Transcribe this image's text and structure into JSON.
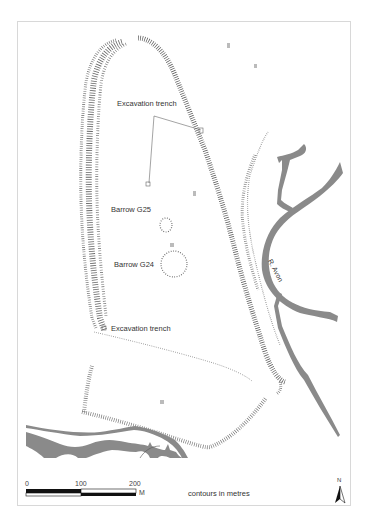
{
  "labels": {
    "trench_north": "Excavation trench",
    "trench_south": "Excavation trench",
    "barrow_g25": "Barrow G25",
    "barrow_g24": "Barrow G24",
    "river": "R. Avon"
  },
  "scale_bar": {
    "ticks": [
      "0",
      "100",
      "200"
    ],
    "unit": "M"
  },
  "contours_note": "contours in metres",
  "north_arrow": {
    "label": "N"
  },
  "colors": {
    "water": "#8a8a8a",
    "hachure": "#555555",
    "frame": "#d8d8d8",
    "text": "#333333"
  }
}
